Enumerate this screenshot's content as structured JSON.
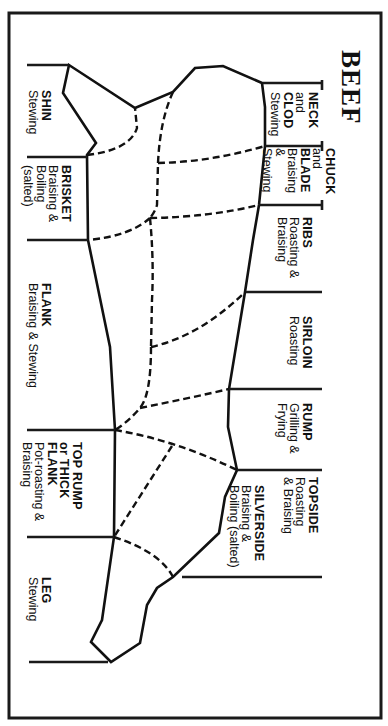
{
  "title": "BEEF",
  "colors": {
    "ink": "#111111",
    "paper": "#ffffff"
  },
  "cuts": {
    "neck": {
      "name": "NECK",
      "lines": [
        "and",
        "CLOD"
      ],
      "use": "Stewing"
    },
    "chuck": {
      "name": "CHUCK",
      "lines": [
        "and",
        "BLADE"
      ],
      "use_lines": [
        "Braising",
        "&",
        "Stewing"
      ]
    },
    "ribs": {
      "name": "RIBS",
      "use_lines": [
        "Roasting &",
        "Braising"
      ]
    },
    "sirloin": {
      "name": "SIRLOIN",
      "use": "Roasting"
    },
    "rump": {
      "name": "RUMP",
      "use_lines": [
        "Grilling &",
        "Frying"
      ]
    },
    "topside": {
      "name": "TOPSIDE",
      "use_lines": [
        "Roasting",
        "& Braising"
      ]
    },
    "silverside": {
      "name": "SILVERSIDE",
      "use_lines": [
        "Braising &",
        "Boiling (salted)"
      ]
    },
    "shin": {
      "name": "SHIN",
      "use": "Stewing"
    },
    "brisket": {
      "name": "BRISKET",
      "use_lines": [
        "Braising &",
        "Boiling",
        "(salted)"
      ]
    },
    "flank": {
      "name": "FLANK",
      "use": "Braising & Stewing"
    },
    "top_rump": {
      "name_lines": [
        "TOP RUMP",
        "or THICK",
        "FLANK"
      ],
      "use_lines": [
        "Pot-roasting &",
        "Braising"
      ]
    },
    "leg": {
      "name": "LEG",
      "use": "Stewing"
    }
  }
}
